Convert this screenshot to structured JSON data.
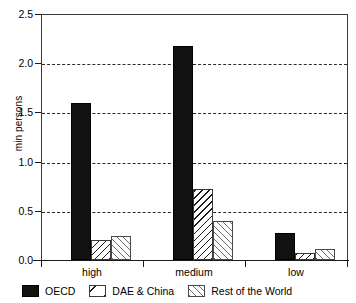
{
  "chart_data": {
    "type": "bar",
    "title": "",
    "xlabel": "",
    "ylabel": "min persons",
    "categories": [
      "high",
      "medium",
      "low"
    ],
    "ylim": [
      0.0,
      2.5
    ],
    "yticks": [
      "0.0",
      "0.5",
      "1.0",
      "1.5",
      "2.0",
      "2.5"
    ],
    "ytick_values": [
      0.0,
      0.5,
      1.0,
      1.5,
      2.0,
      2.5
    ],
    "grid": "horizontal-dashed",
    "legend_position": "below",
    "series": [
      {
        "name": "OECD",
        "pattern": "solid-black",
        "values": [
          1.6,
          2.18,
          0.28
        ]
      },
      {
        "name": "DAE & China",
        "pattern": "backslash-hatch",
        "values": [
          0.2,
          0.73,
          0.07
        ]
      },
      {
        "name": "Rest of the World",
        "pattern": "forwardslash-hatch",
        "values": [
          0.25,
          0.4,
          0.11
        ]
      }
    ]
  },
  "colors": {
    "oecd": "#111111",
    "hatch_dark": "#1b1b1b",
    "hatch_light": "#6b6b6b",
    "axis": "#1a1a1a",
    "grid": "#2b2b2b",
    "background": "#ffffff"
  }
}
